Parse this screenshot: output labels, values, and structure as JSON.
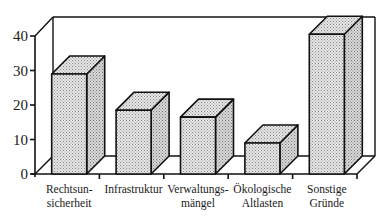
{
  "chart_data": {
    "type": "bar",
    "style": "3d-bar",
    "title": "",
    "xlabel": "",
    "ylabel": "",
    "ylim": [
      0,
      40
    ],
    "yticks": [
      0,
      10,
      20,
      30,
      40
    ],
    "grid": false,
    "legend": "none",
    "categories": [
      [
        "Rechtsun-",
        "sicherheit"
      ],
      [
        "Infrastruktur"
      ],
      [
        "Verwaltungs-",
        "mängel"
      ],
      [
        "Ökologische",
        "Altlasten"
      ],
      [
        "Sonstige",
        "Gründe"
      ]
    ],
    "category_names": [
      "Rechtsunsicherheit",
      "Infrastruktur",
      "Verwaltungsmängel",
      "Ökologische Altlasten",
      "Sonstige Gründe"
    ],
    "values": [
      29,
      18.5,
      16.5,
      9,
      40.5
    ],
    "colors": {
      "bar_fill": "#d6d6d6",
      "bar_side": "#c4c4c4",
      "bar_top": "#cfcfcf",
      "line": "#111111"
    }
  }
}
